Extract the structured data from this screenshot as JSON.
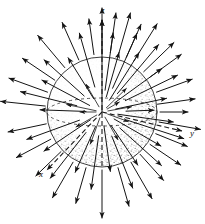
{
  "figure": {
    "background_color": "#ffffff",
    "ink_color": "#1a1a1a",
    "shading_color": "#9a9a9a",
    "width": 205,
    "height": 224
  },
  "sphere": {
    "center_x": 102,
    "center_y": 112,
    "radius": 55,
    "outline_color": "#2a2a2a",
    "outline_width": 0.9,
    "stipple_label": "stippled-shading",
    "equator": {
      "name": "equator-ellipse",
      "rx": 55,
      "ry": 14,
      "dash": "3 3"
    }
  },
  "axes": [
    {
      "name": "z-axis",
      "label": "z",
      "label_x": 101,
      "label_y": 13,
      "x1": 102,
      "y1": 166,
      "x2": 102,
      "y2": 20,
      "dashed_inside": true
    },
    {
      "name": "y-axis",
      "label": "y",
      "label_x": 190,
      "label_y": 136,
      "x1": 102,
      "y1": 112,
      "x2": 182,
      "y2": 131,
      "dashed_inside": true
    },
    {
      "name": "x-axis",
      "label": "x",
      "label_x": 39,
      "label_y": 177,
      "x1": 102,
      "y1": 112,
      "x2": 47,
      "y2": 170,
      "dashed_inside": true
    }
  ],
  "vectors": {
    "name": "radial-field-vectors",
    "description": "Arrows pointing radially outward from the sphere centre",
    "arrow_color": "#141414",
    "head_length": 4.2,
    "count": 48,
    "items": [
      {
        "angle": 90,
        "r0": 0,
        "r1": 92
      },
      {
        "angle": 90,
        "r0": 58,
        "r1": 104
      },
      {
        "angle": 82,
        "r0": 22,
        "r1": 80
      },
      {
        "angle": 82,
        "r0": 60,
        "r1": 100
      },
      {
        "angle": 74,
        "r0": 16,
        "r1": 62
      },
      {
        "angle": 74,
        "r0": 62,
        "r1": 103
      },
      {
        "angle": 66,
        "r0": 26,
        "r1": 86
      },
      {
        "angle": 66,
        "r0": 60,
        "r1": 96
      },
      {
        "angle": 58,
        "r0": 14,
        "r1": 70
      },
      {
        "angle": 58,
        "r0": 60,
        "r1": 104
      },
      {
        "angle": 50,
        "r0": 24,
        "r1": 88
      },
      {
        "angle": 44,
        "r0": 58,
        "r1": 100
      },
      {
        "angle": 36,
        "r0": 16,
        "r1": 74
      },
      {
        "angle": 36,
        "r0": 60,
        "r1": 98
      },
      {
        "angle": 26,
        "r0": 26,
        "r1": 84
      },
      {
        "angle": 20,
        "r0": 58,
        "r1": 96
      },
      {
        "angle": 12,
        "r0": 14,
        "r1": 66
      },
      {
        "angle": 8,
        "r0": 56,
        "r1": 94
      },
      {
        "angle": 2,
        "r0": 24,
        "r1": 52
      },
      {
        "angle": 0,
        "r0": 58,
        "r1": 86
      },
      {
        "angle": -8,
        "r0": 16,
        "r1": 72
      },
      {
        "angle": -10,
        "r0": 58,
        "r1": 100
      },
      {
        "angle": -18,
        "r0": 26,
        "r1": 86
      },
      {
        "angle": -22,
        "r0": 58,
        "r1": 92
      },
      {
        "angle": -30,
        "r0": 14,
        "r1": 68
      },
      {
        "angle": -34,
        "r0": 58,
        "r1": 95
      },
      {
        "angle": -42,
        "r0": 24,
        "r1": 80
      },
      {
        "angle": -48,
        "r0": 57,
        "r1": 92
      },
      {
        "angle": -56,
        "r0": 16,
        "r1": 64
      },
      {
        "angle": -60,
        "r0": 58,
        "r1": 100
      },
      {
        "angle": -68,
        "r0": 26,
        "r1": 82
      },
      {
        "angle": -74,
        "r0": 58,
        "r1": 98
      },
      {
        "angle": -82,
        "r0": 14,
        "r1": 60
      },
      {
        "angle": -90,
        "r0": 58,
        "r1": 106
      },
      {
        "angle": -98,
        "r0": 24,
        "r1": 78
      },
      {
        "angle": -106,
        "r0": 58,
        "r1": 95
      },
      {
        "angle": -114,
        "r0": 16,
        "r1": 66
      },
      {
        "angle": -120,
        "r0": 58,
        "r1": 99
      },
      {
        "angle": -128,
        "r0": 26,
        "r1": 84
      },
      {
        "angle": -136,
        "r0": 57,
        "r1": 92
      },
      {
        "angle": -146,
        "r0": 14,
        "r1": 70
      },
      {
        "angle": -152,
        "r0": 58,
        "r1": 97
      },
      {
        "angle": -160,
        "r0": 24,
        "r1": 80
      },
      {
        "angle": -168,
        "r0": 57,
        "r1": 96
      },
      {
        "angle": 178,
        "r0": 16,
        "r1": 62
      },
      {
        "angle": 174,
        "r0": 57,
        "r1": 102
      },
      {
        "angle": 166,
        "r0": 26,
        "r1": 84
      },
      {
        "angle": 160,
        "r0": 58,
        "r1": 99
      },
      {
        "angle": 152,
        "r0": 14,
        "r1": 68
      },
      {
        "angle": 146,
        "r0": 57,
        "r1": 96
      },
      {
        "angle": 138,
        "r0": 24,
        "r1": 78
      },
      {
        "angle": 130,
        "r0": 58,
        "r1": 100
      },
      {
        "angle": 122,
        "r0": 16,
        "r1": 64
      },
      {
        "angle": 114,
        "r0": 57,
        "r1": 98
      },
      {
        "angle": 106,
        "r0": 26,
        "r1": 82
      },
      {
        "angle": 98,
        "r0": 58,
        "r1": 94
      }
    ]
  },
  "inner_vectors": {
    "name": "interior-field-vectors",
    "description": "Short arrows inside the sphere pointing outward from the centre",
    "items": [
      {
        "angle": 10,
        "r0": 6,
        "r1": 30
      },
      {
        "angle": 44,
        "r0": 6,
        "r1": 34
      },
      {
        "angle": 120,
        "r0": 6,
        "r1": 32
      },
      {
        "angle": 168,
        "r0": 6,
        "r1": 36
      },
      {
        "angle": -150,
        "r0": 6,
        "r1": 30
      },
      {
        "angle": -110,
        "r0": 6,
        "r1": 34
      },
      {
        "angle": -60,
        "r0": 6,
        "r1": 32
      },
      {
        "angle": -20,
        "r0": 6,
        "r1": 28
      },
      {
        "angle": 180,
        "r0": 6,
        "r1": 22
      },
      {
        "angle": 30,
        "r0": 6,
        "r1": 20
      }
    ]
  }
}
